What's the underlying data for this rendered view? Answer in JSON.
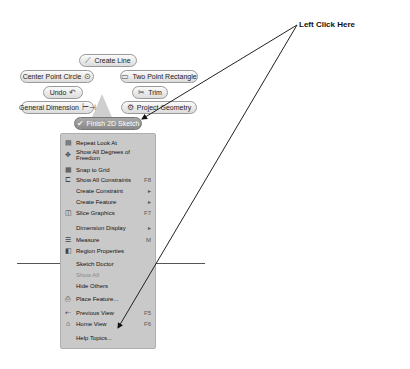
{
  "callout": {
    "text": "Left Click Here"
  },
  "marking_menu": {
    "create_line": "Create Line",
    "center_point_circle": "Center Point Circle",
    "two_point_rectangle": "Two Point Rectangle",
    "undo": "Undo",
    "trim": "Trim",
    "general_dimension": "General Dimension",
    "project_geometry": "Project Geometry",
    "finish_sketch": "Finish 2D Sketch"
  },
  "context_menu": {
    "items": [
      {
        "label": "Repeat Look At",
        "icon": "look-at-icon",
        "shortcut": ""
      },
      {
        "label": "Show All Degrees of Freedom",
        "icon": "dof-icon",
        "shortcut": ""
      },
      {
        "label": "Snap to Grid",
        "icon": "grid-icon",
        "shortcut": ""
      },
      {
        "label": "Show All Constraints",
        "icon": "constraints-icon",
        "shortcut": "F8"
      },
      {
        "label": "Create Constraint",
        "icon": "",
        "shortcut": "▸"
      },
      {
        "label": "Create Feature",
        "icon": "",
        "shortcut": "▸"
      },
      {
        "label": "Slice Graphics",
        "icon": "slice-icon",
        "shortcut": "F7"
      },
      {
        "label": "Dimension Display",
        "icon": "",
        "shortcut": "▸"
      },
      {
        "label": "Measure",
        "icon": "measure-icon",
        "shortcut": "M"
      },
      {
        "label": "Region Properties",
        "icon": "region-icon",
        "shortcut": ""
      },
      {
        "label": "Sketch Doctor",
        "icon": "",
        "shortcut": ""
      },
      {
        "label": "Show All",
        "icon": "",
        "shortcut": "",
        "disabled": true
      },
      {
        "label": "Hide Others",
        "icon": "",
        "shortcut": ""
      },
      {
        "label": "Place Feature...",
        "icon": "place-feature-icon",
        "shortcut": ""
      },
      {
        "label": "Previous View",
        "icon": "previous-view-icon",
        "shortcut": "F5"
      },
      {
        "label": "Home View",
        "icon": "home-icon",
        "shortcut": "F6"
      },
      {
        "label": "Help Topics...",
        "icon": "",
        "shortcut": ""
      }
    ]
  }
}
